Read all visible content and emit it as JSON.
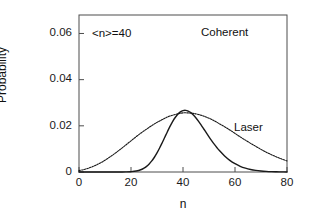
{
  "chart_data": {
    "type": "line",
    "title": "",
    "subtitle": "",
    "xlabel": "n",
    "ylabel": "Probability",
    "xlim": [
      0,
      80
    ],
    "ylim": [
      0,
      0.068
    ],
    "grid": false,
    "legend_position": "inline-annotations",
    "xticks": [
      0,
      20,
      40,
      60,
      80
    ],
    "xtick_labels": [
      "0",
      "20",
      "40",
      "60",
      "80"
    ],
    "yticks": [
      0,
      0.02,
      0.04,
      0.06
    ],
    "ytick_labels": [
      "0",
      "0.02",
      "0.04",
      "0.06"
    ],
    "annotations": [
      {
        "text": "<n>=40",
        "x": 6,
        "y": 0.0595
      },
      {
        "text": "Coherent",
        "x": 46,
        "y": 0.0605
      },
      {
        "text": "Laser",
        "x": 60,
        "y": 0.0215
      }
    ],
    "series": [
      {
        "name": "Coherent",
        "line_style": "solid",
        "color": "#1a1a1a",
        "peak_x": 39,
        "peak_y": 0.0629,
        "x": [
          0,
          2,
          4,
          6,
          8,
          10,
          12,
          14,
          16,
          18,
          20,
          22,
          24,
          25,
          26,
          27,
          28,
          29,
          30,
          31,
          32,
          33,
          34,
          35,
          36,
          37,
          38,
          39,
          40,
          41,
          42,
          43,
          44,
          45,
          46,
          47,
          48,
          49,
          50,
          51,
          52,
          53,
          54,
          56,
          58,
          60,
          62,
          64,
          66,
          68,
          70,
          72,
          74,
          76,
          78,
          80
        ],
        "y": [
          0.0,
          0.0,
          0.0,
          0.0,
          0.0,
          0.0,
          0.0,
          0.0,
          1e-05,
          4e-05,
          0.00014,
          0.00042,
          0.00109,
          0.00166,
          0.00245,
          0.00348,
          0.00479,
          0.00639,
          0.00826,
          0.01038,
          0.01268,
          0.01507,
          0.01746,
          0.01974,
          0.02183,
          0.02361,
          0.02503,
          0.02603,
          0.02659,
          0.02671,
          0.0264,
          0.02571,
          0.02469,
          0.02341,
          0.02193,
          0.02031,
          0.01862,
          0.01691,
          0.01522,
          0.01358,
          0.01204,
          0.0106,
          0.00928,
          0.00694,
          0.00506,
          0.00359,
          0.00247,
          0.00166,
          0.00108,
          0.00069,
          0.00043,
          0.00026,
          0.00015,
          9e-05,
          5e-05,
          3e-05
        ]
      },
      {
        "name": "Laser",
        "line_style": "dotted",
        "color": "#1a1a1a",
        "peak_x": 40,
        "peak_y": 0.0256,
        "x": [
          0,
          2,
          4,
          6,
          8,
          10,
          12,
          14,
          16,
          18,
          20,
          22,
          24,
          26,
          28,
          30,
          32,
          34,
          36,
          38,
          40,
          42,
          44,
          46,
          48,
          50,
          52,
          54,
          56,
          58,
          60,
          62,
          64,
          66,
          68,
          70,
          72,
          74,
          76,
          78,
          80
        ],
        "y": [
          0.0006,
          0.0011,
          0.0018,
          0.0027,
          0.0038,
          0.0051,
          0.0066,
          0.0082,
          0.0099,
          0.0117,
          0.0135,
          0.0153,
          0.017,
          0.0186,
          0.0201,
          0.0215,
          0.0227,
          0.0238,
          0.0246,
          0.0252,
          0.0256,
          0.0256,
          0.0254,
          0.0249,
          0.0242,
          0.0233,
          0.0222,
          0.0209,
          0.0196,
          0.0182,
          0.0167,
          0.0152,
          0.0138,
          0.0124,
          0.0111,
          0.0098,
          0.0086,
          0.0075,
          0.0065,
          0.0056,
          0.0048
        ]
      }
    ]
  },
  "axes": {
    "ylabel": "Probability",
    "xlabel": "n"
  }
}
